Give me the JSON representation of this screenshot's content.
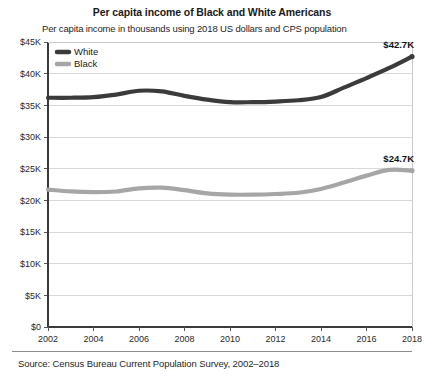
{
  "chart_data": {
    "type": "line",
    "title": "Per capita income of Black and White Americans",
    "subtitle": "Per capita income in thousands using 2018 US dollars and CPS population",
    "source": "Source: Census Bureau Current Population Survey, 2002–2018",
    "xlabel": "",
    "ylabel": "",
    "x": [
      2002,
      2003,
      2004,
      2005,
      2006,
      2007,
      2008,
      2009,
      2010,
      2011,
      2012,
      2013,
      2014,
      2015,
      2016,
      2017,
      2018
    ],
    "xlim": [
      2002,
      2018
    ],
    "ylim": [
      0,
      45000
    ],
    "xticks": [
      2002,
      2004,
      2006,
      2008,
      2010,
      2012,
      2014,
      2016,
      2018
    ],
    "xtick_labels": [
      "2002",
      "2004",
      "2006",
      "2008",
      "2010",
      "2012",
      "2014",
      "2016",
      "2018"
    ],
    "yticks": [
      0,
      5000,
      10000,
      15000,
      20000,
      25000,
      30000,
      35000,
      40000,
      45000
    ],
    "ytick_labels": [
      "$0",
      "$5K",
      "$10K",
      "$15K",
      "$20K",
      "$25K",
      "$30K",
      "$35K",
      "$40K",
      "$45K"
    ],
    "grid": true,
    "grid_axis": "y",
    "legend_position": "top-left",
    "series": [
      {
        "name": "White",
        "color": "#3b3b3b",
        "values": [
          36200,
          36200,
          36300,
          36700,
          37300,
          37200,
          36500,
          35900,
          35500,
          35500,
          35600,
          35800,
          36300,
          37800,
          39300,
          40900,
          42700
        ],
        "end_label": "$42.7K"
      },
      {
        "name": "Black",
        "color": "#a6a6a6",
        "values": [
          21700,
          21400,
          21300,
          21400,
          21900,
          22000,
          21600,
          21100,
          20900,
          20900,
          21000,
          21200,
          21800,
          22800,
          23900,
          24800,
          24700
        ],
        "end_label": "$24.7K"
      }
    ]
  },
  "legend": {
    "items": [
      {
        "label": "White",
        "color": "#3b3b3b"
      },
      {
        "label": "Black",
        "color": "#a6a6a6"
      }
    ]
  }
}
